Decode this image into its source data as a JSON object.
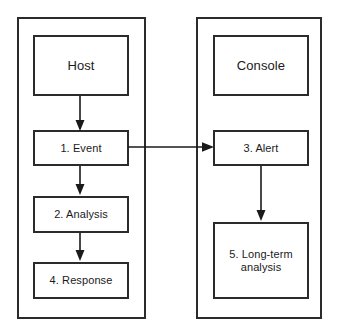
{
  "diagram": {
    "background_color": "#ffffff",
    "line_color": "#1a1a1a",
    "border_color": "#2b2b2b",
    "groups": [
      {
        "id": "host",
        "header_label": "Host",
        "nodes": [
          {
            "id": "event",
            "label": "1. Event"
          },
          {
            "id": "analysis",
            "label": "2. Analysis"
          },
          {
            "id": "response",
            "label": "4. Response"
          }
        ]
      },
      {
        "id": "console",
        "header_label": "Console",
        "nodes": [
          {
            "id": "alert",
            "label": "3. Alert"
          },
          {
            "id": "longterm",
            "label": "5. Long-term\nanalysis"
          }
        ]
      }
    ],
    "connectors": [
      {
        "id": "host-to-event",
        "from": "host",
        "to": "event",
        "direction": "down",
        "arrowhead": "filled-triangle"
      },
      {
        "id": "event-to-analysis",
        "from": "event",
        "to": "analysis",
        "direction": "down",
        "arrowhead": "filled-triangle"
      },
      {
        "id": "analysis-to-response",
        "from": "analysis",
        "to": "response",
        "direction": "down",
        "arrowhead": "filled-triangle"
      },
      {
        "id": "event-to-alert",
        "from": "event",
        "to": "alert",
        "direction": "right",
        "arrowhead": "filled-triangle"
      },
      {
        "id": "alert-to-longterm",
        "from": "alert",
        "to": "longterm",
        "direction": "down",
        "arrowhead": "filled-triangle"
      }
    ]
  }
}
